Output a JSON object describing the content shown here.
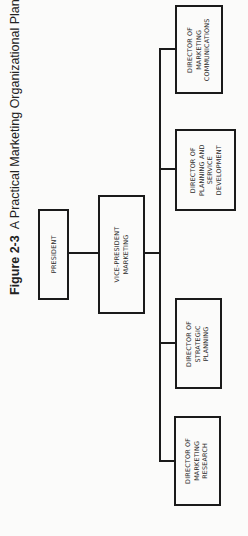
{
  "figure": {
    "label": "Figure 2-3",
    "title": "A Practical Marketing Organizational Plan"
  },
  "chart": {
    "president": "PRESIDENT",
    "vice_president": "VICE-PRESIDENT\nMARKETING",
    "directors": [
      "DIRECTOR OF\nMARKETING\nCOMMUNICATIONS",
      "DIRECTOR OF\nPLANNING AND\nSERVICE\nDEVELOPMENT",
      "DIRECTOR OF\nSTRATEGIC\nPLANNING",
      "DIRECTOR OF\nMARKETING\nRESEARCH"
    ]
  }
}
